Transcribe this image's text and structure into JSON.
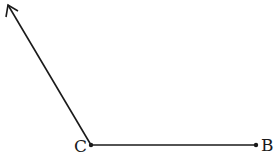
{
  "diagram": {
    "type": "angle",
    "vertex": {
      "label": "C",
      "x": 91,
      "y": 145
    },
    "ray_point": {
      "label": "B",
      "x": 256,
      "y": 145
    },
    "ray_arrow": {
      "x": 8,
      "y": 5
    },
    "stroke_color": "#1a1a1a"
  }
}
